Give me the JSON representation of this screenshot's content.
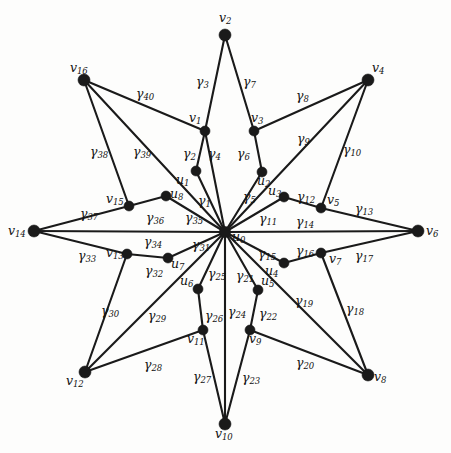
{
  "figure": {
    "title": "",
    "width": 451,
    "height": 453,
    "background_color": "#fdfdfc",
    "ink_color": "#1a1a1a"
  },
  "graph": {
    "type": "star-polygon-graph",
    "center_vertex": "u0",
    "vertex_count": 25,
    "edge_count": 40,
    "vertices": [
      {
        "id": "u0",
        "label_main": "u",
        "label_sub": "0",
        "x": 225,
        "y": 232,
        "r": 5.6,
        "label_x": 232,
        "label_y": 231,
        "anchor": "left"
      },
      {
        "id": "v1",
        "label_main": "v",
        "label_sub": "1",
        "x": 205,
        "y": 131,
        "r": 5.0,
        "label_x": 189,
        "label_y": 112,
        "anchor": "left"
      },
      {
        "id": "u1",
        "label_main": "u",
        "label_sub": "1",
        "x": 196,
        "y": 171,
        "r": 5.0,
        "label_x": 176,
        "label_y": 174,
        "anchor": "left"
      },
      {
        "id": "v2",
        "label_main": "v",
        "label_sub": "2",
        "x": 225,
        "y": 35,
        "r": 6.0,
        "label_x": 219,
        "label_y": 12,
        "anchor": "left"
      },
      {
        "id": "v3",
        "label_main": "v",
        "label_sub": "3",
        "x": 254,
        "y": 131,
        "r": 5.0,
        "label_x": 251,
        "label_y": 112,
        "anchor": "left"
      },
      {
        "id": "u2",
        "label_main": "u",
        "label_sub": "2",
        "x": 262,
        "y": 172,
        "r": 5.0,
        "label_x": 257,
        "label_y": 175,
        "anchor": "left"
      },
      {
        "id": "v4",
        "label_main": "v",
        "label_sub": "4",
        "x": 368,
        "y": 80,
        "r": 6.0,
        "label_x": 372,
        "label_y": 62,
        "anchor": "left"
      },
      {
        "id": "u3",
        "label_main": "u",
        "label_sub": "3",
        "x": 284,
        "y": 197,
        "r": 5.0,
        "label_x": 268,
        "label_y": 185,
        "anchor": "left"
      },
      {
        "id": "v5",
        "label_main": "v",
        "label_sub": "5",
        "x": 321,
        "y": 208,
        "r": 5.0,
        "label_x": 327,
        "label_y": 194,
        "anchor": "left"
      },
      {
        "id": "v6",
        "label_main": "v",
        "label_sub": "6",
        "x": 418,
        "y": 231,
        "r": 6.0,
        "label_x": 426,
        "label_y": 225,
        "anchor": "left"
      },
      {
        "id": "u4",
        "label_main": "u",
        "label_sub": "4",
        "x": 284,
        "y": 263,
        "r": 5.0,
        "label_x": 265,
        "label_y": 265,
        "anchor": "left"
      },
      {
        "id": "v7",
        "label_main": "v",
        "label_sub": "7",
        "x": 321,
        "y": 253,
        "r": 5.0,
        "label_x": 329,
        "label_y": 253,
        "anchor": "left"
      },
      {
        "id": "u5",
        "label_main": "u",
        "label_sub": "5",
        "x": 258,
        "y": 290,
        "r": 5.0,
        "label_x": 261,
        "label_y": 275,
        "anchor": "left"
      },
      {
        "id": "v8",
        "label_main": "v",
        "label_sub": "8",
        "x": 368,
        "y": 375,
        "r": 6.0,
        "label_x": 374,
        "label_y": 371,
        "anchor": "left"
      },
      {
        "id": "v9",
        "label_main": "v",
        "label_sub": "9",
        "x": 250,
        "y": 330,
        "r": 5.0,
        "label_x": 249,
        "label_y": 333,
        "anchor": "left"
      },
      {
        "id": "v10",
        "label_main": "v",
        "label_sub": "10",
        "x": 225,
        "y": 424,
        "r": 6.0,
        "label_x": 215,
        "label_y": 428,
        "anchor": "left"
      },
      {
        "id": "u6",
        "label_main": "u",
        "label_sub": "6",
        "x": 198,
        "y": 289,
        "r": 5.0,
        "label_x": 180,
        "label_y": 275,
        "anchor": "left"
      },
      {
        "id": "v11",
        "label_main": "v",
        "label_sub": "11",
        "x": 203,
        "y": 330,
        "r": 5.0,
        "label_x": 187,
        "label_y": 333,
        "anchor": "left"
      },
      {
        "id": "v12",
        "label_main": "v",
        "label_sub": "12",
        "x": 85,
        "y": 372,
        "r": 6.0,
        "label_x": 66,
        "label_y": 375,
        "anchor": "left"
      },
      {
        "id": "u7",
        "label_main": "u",
        "label_sub": "7",
        "x": 168,
        "y": 258,
        "r": 5.0,
        "label_x": 171,
        "label_y": 258,
        "anchor": "left"
      },
      {
        "id": "v13",
        "label_main": "v",
        "label_sub": "13",
        "x": 127,
        "y": 254,
        "r": 5.0,
        "label_x": 106,
        "label_y": 247,
        "anchor": "left"
      },
      {
        "id": "v14",
        "label_main": "v",
        "label_sub": "14",
        "x": 34,
        "y": 231,
        "r": 6.0,
        "label_x": 8,
        "label_y": 225,
        "anchor": "left"
      },
      {
        "id": "u8",
        "label_main": "u",
        "label_sub": "8",
        "x": 166,
        "y": 196,
        "r": 5.0,
        "label_x": 170,
        "label_y": 188,
        "anchor": "left"
      },
      {
        "id": "v15",
        "label_main": "v",
        "label_sub": "15",
        "x": 129,
        "y": 206,
        "r": 5.0,
        "label_x": 106,
        "label_y": 193,
        "anchor": "left"
      },
      {
        "id": "v16",
        "label_main": "v",
        "label_sub": "16",
        "x": 84,
        "y": 80,
        "r": 6.0,
        "label_x": 70,
        "label_y": 62,
        "anchor": "left"
      }
    ],
    "edges": [
      {
        "id": "g1",
        "label_main": "γ",
        "label_sub": "1",
        "from": "u1",
        "to": "u0",
        "label_x": 198,
        "label_y": 195
      },
      {
        "id": "g2",
        "label_main": "γ",
        "label_sub": "2",
        "from": "v1",
        "to": "u1",
        "label_x": 183,
        "label_y": 148
      },
      {
        "id": "g3",
        "label_main": "γ",
        "label_sub": "3",
        "from": "v2",
        "to": "v1",
        "label_x": 196,
        "label_y": 76
      },
      {
        "id": "g4",
        "label_main": "γ",
        "label_sub": "4",
        "from": "v1",
        "to": "u0",
        "label_x": 208,
        "label_y": 148
      },
      {
        "id": "g5",
        "label_main": "γ",
        "label_sub": "5",
        "from": "u2",
        "to": "u0",
        "label_x": 243,
        "label_y": 191
      },
      {
        "id": "g6",
        "label_main": "γ",
        "label_sub": "6",
        "from": "v3",
        "to": "u2",
        "label_x": 237,
        "label_y": 148
      },
      {
        "id": "g7",
        "label_main": "γ",
        "label_sub": "7",
        "from": "v2",
        "to": "v3",
        "label_x": 243,
        "label_y": 76
      },
      {
        "id": "g8",
        "label_main": "γ",
        "label_sub": "8",
        "from": "v3",
        "to": "v4",
        "label_x": 296,
        "label_y": 90
      },
      {
        "id": "g9",
        "label_main": "γ",
        "label_sub": "9",
        "from": "v4",
        "to": "u0",
        "label_x": 297,
        "label_y": 133
      },
      {
        "id": "g10",
        "label_main": "γ",
        "label_sub": "10",
        "from": "v4",
        "to": "v5",
        "label_x": 343,
        "label_y": 144
      },
      {
        "id": "g11",
        "label_main": "γ",
        "label_sub": "11",
        "from": "u3",
        "to": "u0",
        "label_x": 259,
        "label_y": 213
      },
      {
        "id": "g12",
        "label_main": "γ",
        "label_sub": "12",
        "from": "u3",
        "to": "v5",
        "label_x": 297,
        "label_y": 191
      },
      {
        "id": "g13",
        "label_main": "γ",
        "label_sub": "13",
        "from": "v5",
        "to": "v6",
        "label_x": 355,
        "label_y": 203
      },
      {
        "id": "g14",
        "label_main": "γ",
        "label_sub": "14",
        "from": "v6",
        "to": "u0",
        "label_x": 296,
        "label_y": 216
      },
      {
        "id": "g15",
        "label_main": "γ",
        "label_sub": "15",
        "from": "u4",
        "to": "u0",
        "label_x": 258,
        "label_y": 248
      },
      {
        "id": "g16",
        "label_main": "γ",
        "label_sub": "16",
        "from": "u4",
        "to": "v7",
        "label_x": 296,
        "label_y": 245
      },
      {
        "id": "g17",
        "label_main": "γ",
        "label_sub": "17",
        "from": "v7",
        "to": "v6",
        "label_x": 355,
        "label_y": 250
      },
      {
        "id": "g18",
        "label_main": "γ",
        "label_sub": "18",
        "from": "v7",
        "to": "v8",
        "label_x": 346,
        "label_y": 303
      },
      {
        "id": "g19",
        "label_main": "γ",
        "label_sub": "19",
        "from": "u0",
        "to": "v8",
        "label_x": 295,
        "label_y": 295
      },
      {
        "id": "g20",
        "label_main": "γ",
        "label_sub": "20",
        "from": "v9",
        "to": "v8",
        "label_x": 296,
        "label_y": 357
      },
      {
        "id": "g21",
        "label_main": "γ",
        "label_sub": "21",
        "from": "u5",
        "to": "u0",
        "label_x": 236,
        "label_y": 270
      },
      {
        "id": "g22",
        "label_main": "γ",
        "label_sub": "22",
        "from": "u5",
        "to": "v9",
        "label_x": 259,
        "label_y": 308
      },
      {
        "id": "g23",
        "label_main": "γ",
        "label_sub": "23",
        "from": "v9",
        "to": "v10",
        "label_x": 242,
        "label_y": 372
      },
      {
        "id": "g24",
        "label_main": "γ",
        "label_sub": "24",
        "from": "u0",
        "to": "v10",
        "label_x": 228,
        "label_y": 306
      },
      {
        "id": "g25",
        "label_main": "γ",
        "label_sub": "25",
        "from": "u6",
        "to": "u0",
        "label_x": 208,
        "label_y": 268
      },
      {
        "id": "g26",
        "label_main": "γ",
        "label_sub": "26",
        "from": "u6",
        "to": "v11",
        "label_x": 205,
        "label_y": 310
      },
      {
        "id": "g27",
        "label_main": "γ",
        "label_sub": "27",
        "from": "v11",
        "to": "v10",
        "label_x": 193,
        "label_y": 371
      },
      {
        "id": "g28",
        "label_main": "γ",
        "label_sub": "28",
        "from": "v12",
        "to": "v11",
        "label_x": 144,
        "label_y": 359
      },
      {
        "id": "g29",
        "label_main": "γ",
        "label_sub": "29",
        "from": "v12",
        "to": "u0",
        "label_x": 148,
        "label_y": 310
      },
      {
        "id": "g30",
        "label_main": "γ",
        "label_sub": "30",
        "from": "v13",
        "to": "v12",
        "label_x": 101,
        "label_y": 305
      },
      {
        "id": "g31",
        "label_main": "γ",
        "label_sub": "31",
        "from": "u7",
        "to": "u0",
        "label_x": 192,
        "label_y": 239
      },
      {
        "id": "g32",
        "label_main": "γ",
        "label_sub": "32",
        "from": "v13",
        "to": "u7",
        "label_x": 145,
        "label_y": 265
      },
      {
        "id": "g33",
        "label_main": "γ",
        "label_sub": "33",
        "from": "v14",
        "to": "v13",
        "label_x": 78,
        "label_y": 250
      },
      {
        "id": "g34",
        "label_main": "γ",
        "label_sub": "34",
        "from": "v14",
        "to": "u0",
        "label_x": 144,
        "label_y": 236
      },
      {
        "id": "g35",
        "label_main": "γ",
        "label_sub": "35",
        "from": "u8",
        "to": "u0",
        "label_x": 185,
        "label_y": 212
      },
      {
        "id": "g36",
        "label_main": "γ",
        "label_sub": "36",
        "from": "v15",
        "to": "u8",
        "label_x": 146,
        "label_y": 212
      },
      {
        "id": "g37",
        "label_main": "γ",
        "label_sub": "37",
        "from": "v14",
        "to": "v15",
        "label_x": 80,
        "label_y": 208
      },
      {
        "id": "g38",
        "label_main": "γ",
        "label_sub": "38",
        "from": "v16",
        "to": "v15",
        "label_x": 90,
        "label_y": 146
      },
      {
        "id": "g39",
        "label_main": "γ",
        "label_sub": "39",
        "from": "v16",
        "to": "u0",
        "label_x": 133,
        "label_y": 146
      },
      {
        "id": "g40",
        "label_main": "γ",
        "label_sub": "40",
        "from": "v16",
        "to": "v1",
        "label_x": 136,
        "label_y": 88
      }
    ]
  }
}
